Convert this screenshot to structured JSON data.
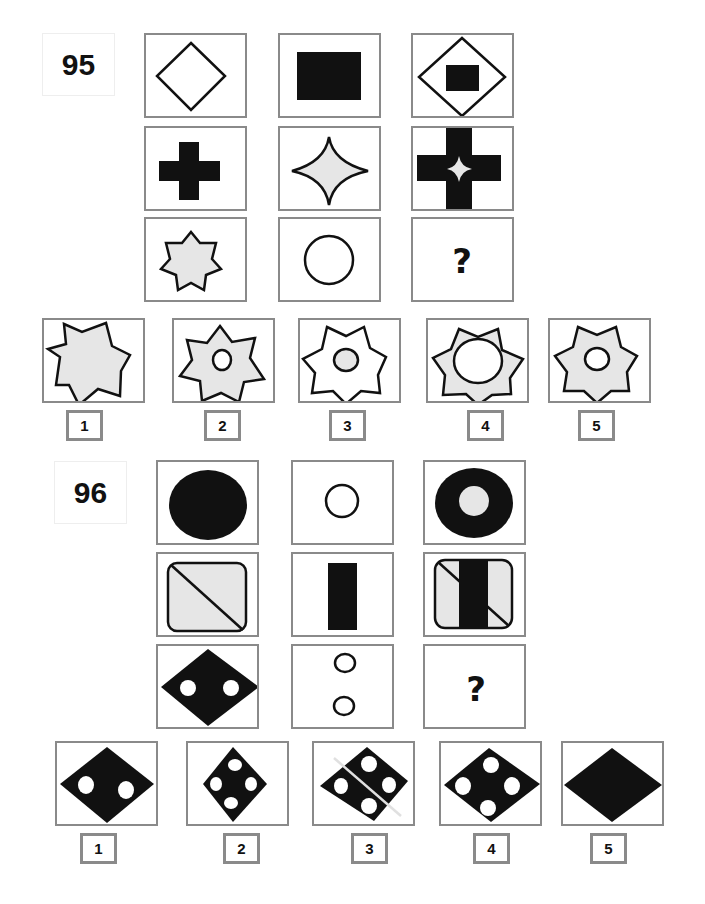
{
  "puzzles": [
    {
      "number": "95",
      "grid": [
        [
          "outline diamond",
          "black rectangle",
          "outline diamond containing black square"
        ],
        [
          "black cross",
          "gray four-pointed star",
          "black cross containing gray four-pointed star"
        ],
        [
          "gray seven-pointed star",
          "outline circle",
          "?"
        ]
      ],
      "question_mark": "?",
      "answer_options": [
        {
          "label": "1",
          "description": "large gray seven-pointed star, no circle"
        },
        {
          "label": "2",
          "description": "gray seven-pointed star with small white circle"
        },
        {
          "label": "3",
          "description": "white seven-pointed star with small gray circle"
        },
        {
          "label": "4",
          "description": "gray seven-pointed star with large white circle"
        },
        {
          "label": "5",
          "description": "gray seven-pointed star with small white circle"
        }
      ]
    },
    {
      "number": "96",
      "grid": [
        [
          "black ellipse",
          "small outline circle",
          "black ellipse with gray center circle"
        ],
        [
          "gray rounded rectangle with diagonal",
          "black vertical bar",
          "rounded rectangle with diagonal and black bar"
        ],
        [
          "black diamond with two white dots",
          "two outline circles stacked",
          "?"
        ]
      ],
      "question_mark": "?",
      "answer_options": [
        {
          "label": "1",
          "description": "black diamond with two white dots"
        },
        {
          "label": "2",
          "description": "black diamond with four white dots"
        },
        {
          "label": "3",
          "description": "black diamond split by line with four white dots"
        },
        {
          "label": "4",
          "description": "wide black diamond with four white dots"
        },
        {
          "label": "5",
          "description": "plain black diamond"
        }
      ]
    }
  ],
  "colors": {
    "frame": "#8a8a8a",
    "shape_black": "#111111",
    "shape_gray": "#e6e6e6"
  }
}
